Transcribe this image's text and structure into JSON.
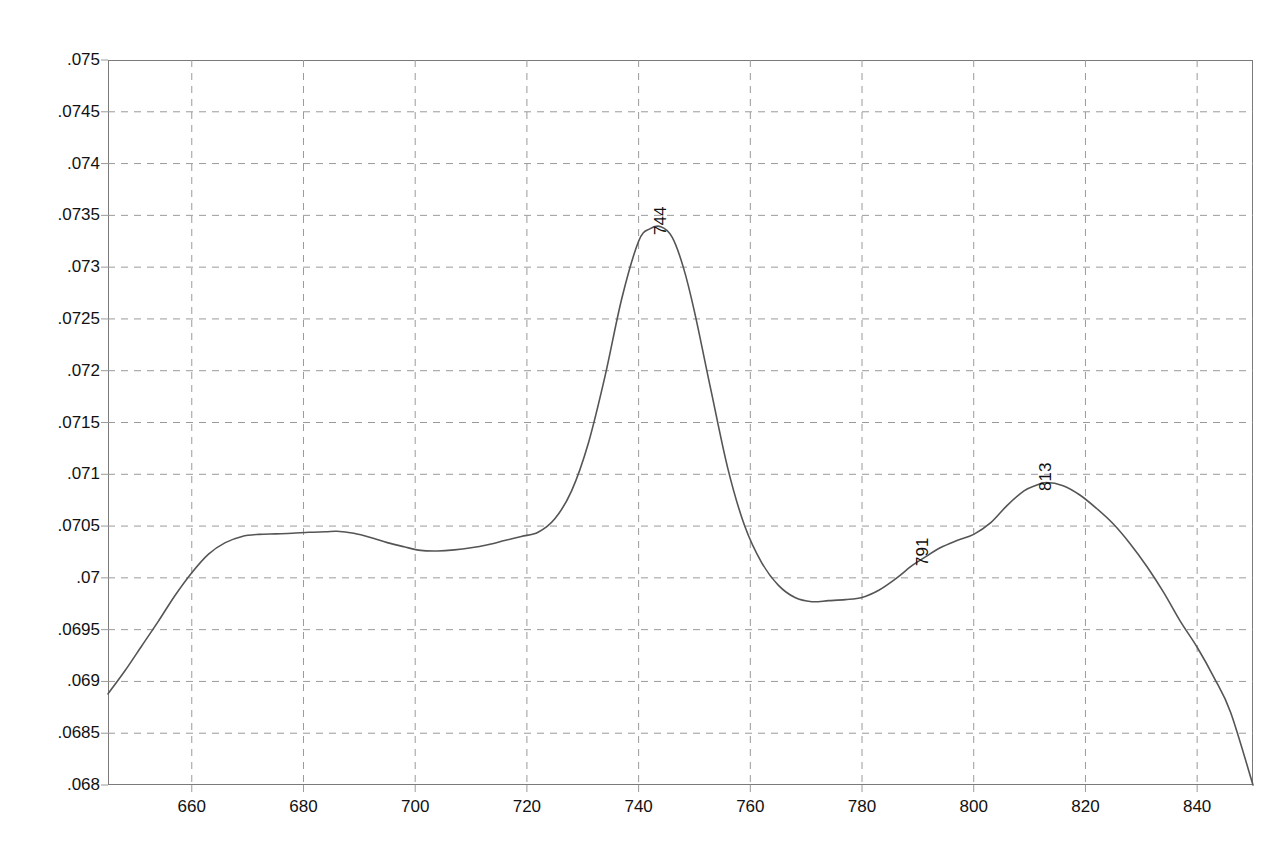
{
  "chart_data": {
    "type": "line",
    "title": "",
    "subtitle": "",
    "xlabel": "",
    "ylabel": "",
    "xlim": [
      645,
      850
    ],
    "ylim": [
      0.068,
      0.075
    ],
    "grid": true,
    "legend": "none",
    "x_ticks": [
      660,
      680,
      700,
      720,
      740,
      760,
      780,
      800,
      820,
      840
    ],
    "x_tick_labels": [
      "660",
      "680",
      "700",
      "720",
      "740",
      "760",
      "780",
      "800",
      "820",
      "840"
    ],
    "y_ticks": [
      0.068,
      0.0685,
      0.069,
      0.0695,
      0.07,
      0.0705,
      0.071,
      0.0715,
      0.072,
      0.0725,
      0.073,
      0.0735,
      0.074,
      0.0745,
      0.075
    ],
    "y_tick_labels": [
      ".068",
      ".0685",
      ".069",
      ".0695",
      ".07",
      ".0705",
      ".071",
      ".0715",
      ".072",
      ".0725",
      ".073",
      ".0735",
      ".074",
      ".0745",
      ".075"
    ],
    "series": [
      {
        "name": "absorbance",
        "color": "#555555",
        "x": [
          645,
          648,
          651,
          654,
          657,
          660,
          663,
          666,
          669,
          672,
          675,
          678,
          681,
          684,
          686,
          689,
          692,
          695,
          698,
          701,
          704,
          707,
          710,
          713,
          716,
          719,
          722,
          725,
          728,
          731,
          734,
          737,
          740,
          742,
          744,
          746,
          748,
          750,
          753,
          756,
          759,
          762,
          765,
          768,
          771,
          774,
          777,
          780,
          783,
          786,
          789,
          791,
          794,
          797,
          800,
          803,
          806,
          809,
          811,
          813,
          816,
          819,
          822,
          825,
          828,
          831,
          834,
          837,
          840,
          843,
          846,
          850
        ],
        "y": [
          0.06888,
          0.0691,
          0.06934,
          0.06958,
          0.06983,
          0.07005,
          0.07023,
          0.07034,
          0.0704,
          0.07042,
          0.070425,
          0.07043,
          0.07044,
          0.070445,
          0.07045,
          0.07043,
          0.07039,
          0.07034,
          0.0703,
          0.070265,
          0.07026,
          0.07027,
          0.07029,
          0.07032,
          0.07036,
          0.0704,
          0.07044,
          0.07057,
          0.07084,
          0.0713,
          0.07195,
          0.0727,
          0.07325,
          0.07337,
          0.07339,
          0.07329,
          0.073,
          0.07257,
          0.0718,
          0.07105,
          0.0705,
          0.07015,
          0.06993,
          0.06981,
          0.06977,
          0.06978,
          0.06979,
          0.06981,
          0.06988,
          0.06999,
          0.07012,
          0.07019,
          0.07029,
          0.07036,
          0.07042,
          0.07053,
          0.0707,
          0.07084,
          0.07089,
          0.07092,
          0.07089,
          0.0708,
          0.07067,
          0.07052,
          0.07033,
          0.07011,
          0.06986,
          0.06958,
          0.06933,
          0.06904,
          0.0687,
          0.068
        ]
      }
    ],
    "annotations": [
      {
        "label": "744",
        "x": 744,
        "y": 0.07339,
        "rotation": -90
      },
      {
        "label": "791",
        "x": 791,
        "y": 0.07019,
        "rotation": -90
      },
      {
        "label": "813",
        "x": 813,
        "y": 0.07092,
        "rotation": -90
      }
    ],
    "colors": {
      "curve": "#555555",
      "grid": "#9a9a9a",
      "axis": "#7a7a7a",
      "background": "#ffffff",
      "text": "#111111"
    }
  }
}
